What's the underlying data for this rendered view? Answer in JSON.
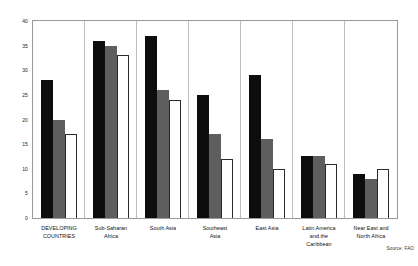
{
  "source_note": "Source: FAO",
  "chart_data": {
    "type": "bar",
    "title": "",
    "subtitle": "",
    "xlabel": "",
    "ylabel": "",
    "ylim": [
      0,
      40
    ],
    "yticks": [
      0,
      5,
      10,
      15,
      20,
      25,
      30,
      35,
      40
    ],
    "grid": false,
    "legend": "none",
    "categories": [
      "DEVELOPING COUNTRIES",
      "Sub-Saharan Africa",
      "South Asia",
      "Southeast Asia",
      "East Asia",
      "Latin America and the Caribbean",
      "Near East and North Africa"
    ],
    "category_lines": [
      [
        "DEVELOPING",
        "COUNTRIES"
      ],
      [
        "Sub-Saharan",
        "Africa"
      ],
      [
        "South Asia"
      ],
      [
        "Southeast",
        "Asia"
      ],
      [
        "East Asia"
      ],
      [
        "Latin America",
        "and the",
        "Caribbean"
      ],
      [
        "Near East and",
        "North Africa"
      ]
    ],
    "series": [
      {
        "name": "series-1",
        "color": "#0d0d0d",
        "style": "solid-black",
        "values": [
          28,
          36,
          37,
          25,
          29,
          12.5,
          9
        ]
      },
      {
        "name": "series-2",
        "color": "#5e5e5e",
        "style": "solid-gray",
        "values": [
          20,
          35,
          26,
          17,
          16,
          12.5,
          8
        ]
      },
      {
        "name": "series-3",
        "color": "#ffffff",
        "style": "outlined-white",
        "values": [
          17,
          33,
          24,
          12,
          10,
          11,
          10
        ]
      }
    ]
  }
}
